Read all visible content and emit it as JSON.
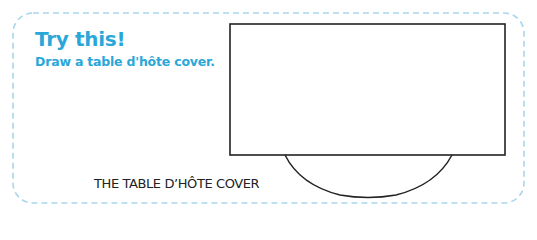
{
  "box": {
    "heading": "Try this!",
    "instruction": "Draw a table d'hôte cover.",
    "border_color": "#a9d6ec",
    "accent_color": "#2aa7d9"
  },
  "diagram": {
    "caption": "THE TABLE D’HÔTE COVER",
    "shapes": [
      "rectangle-table",
      "semicircle-cover"
    ],
    "stroke_color": "#222222"
  }
}
